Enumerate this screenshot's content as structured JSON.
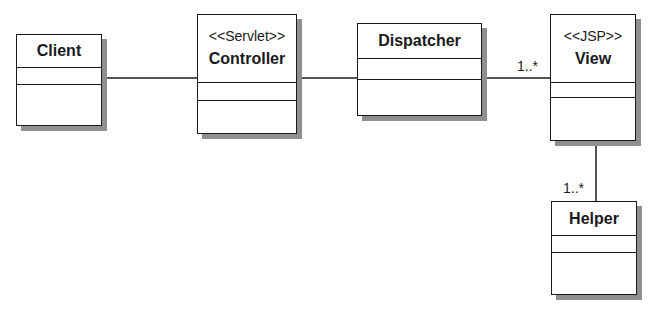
{
  "diagram": {
    "type": "UML class diagram",
    "classes": [
      {
        "id": "client",
        "name": "Client",
        "stereotype": ""
      },
      {
        "id": "controller",
        "name": "Controller",
        "stereotype": "<<Servlet>>"
      },
      {
        "id": "dispatcher",
        "name": "Dispatcher",
        "stereotype": ""
      },
      {
        "id": "view",
        "name": "View",
        "stereotype": "<<JSP>>"
      },
      {
        "id": "helper",
        "name": "Helper",
        "stereotype": ""
      }
    ],
    "associations": [
      {
        "from": "Client",
        "to": "Controller",
        "multiplicity": ""
      },
      {
        "from": "Controller",
        "to": "Dispatcher",
        "multiplicity": ""
      },
      {
        "from": "Dispatcher",
        "to": "View",
        "multiplicity": "1..*"
      },
      {
        "from": "View",
        "to": "Helper",
        "multiplicity": "1..*"
      }
    ]
  }
}
